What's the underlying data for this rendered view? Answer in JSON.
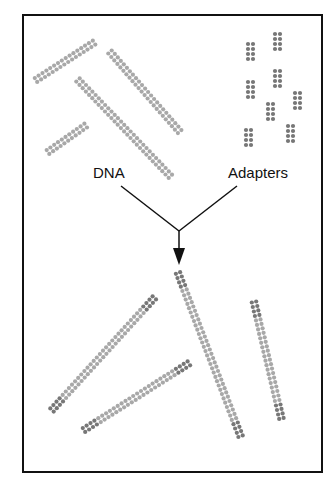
{
  "diagram": {
    "labels": {
      "dna": "DNA",
      "adapters": "Adapters"
    },
    "colors": {
      "border": "#111111",
      "dna_dot": "#a8a8a8",
      "adapter_dot": "#777777",
      "arrow": "#111111",
      "text": "#111111"
    },
    "dna_fragments": [
      {
        "x1": 36,
        "y1": 80,
        "x2": 95,
        "y2": 42
      },
      {
        "x1": 110,
        "y1": 52,
        "x2": 180,
        "y2": 132
      },
      {
        "x1": 78,
        "y1": 80,
        "x2": 172,
        "y2": 178
      },
      {
        "x1": 48,
        "y1": 152,
        "x2": 88,
        "y2": 124
      }
    ],
    "adapters": [
      {
        "x": 248,
        "y": 44
      },
      {
        "x": 275,
        "y": 34
      },
      {
        "x": 248,
        "y": 82
      },
      {
        "x": 275,
        "y": 71
      },
      {
        "x": 268,
        "y": 104
      },
      {
        "x": 295,
        "y": 93
      },
      {
        "x": 246,
        "y": 130
      },
      {
        "x": 288,
        "y": 126
      }
    ],
    "ligated_products": [
      {
        "x1": 178,
        "y1": 273,
        "x2": 242,
        "y2": 440,
        "adapter_ends": true
      },
      {
        "x1": 52,
        "y1": 410,
        "x2": 156,
        "y2": 296,
        "adapter_ends": true
      },
      {
        "x1": 84,
        "y1": 430,
        "x2": 191,
        "y2": 362,
        "adapter_ends": true
      },
      {
        "x1": 254,
        "y1": 302,
        "x2": 282,
        "y2": 421,
        "adapter_ends": true
      }
    ]
  }
}
